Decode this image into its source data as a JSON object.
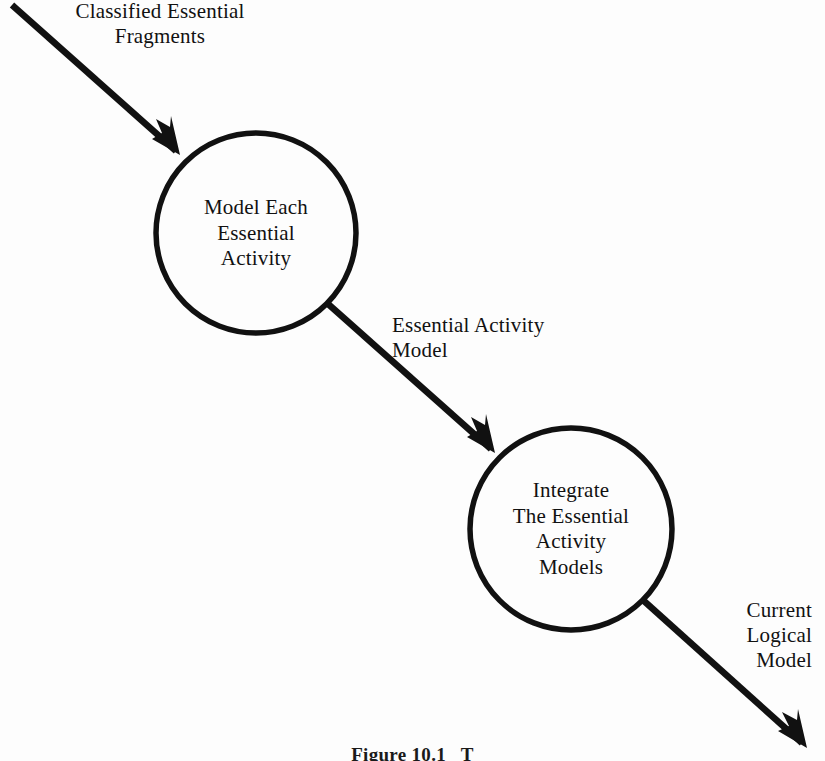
{
  "figure": {
    "caption": "Figure 10.1   T",
    "background_color": "#fdfdfd",
    "ink_color": "#111111"
  },
  "diagram": {
    "type": "process-flow",
    "nodes": [
      {
        "id": "model-each-essential-activity",
        "shape": "circle",
        "label": "Model Each\nEssential\nActivity",
        "cx": 256,
        "cy": 233,
        "r": 100
      },
      {
        "id": "integrate-the-essential-activity-models",
        "shape": "circle",
        "label": "Integrate\nThe Essential\nActivity\nModels",
        "cx": 571,
        "cy": 529,
        "r": 101
      }
    ],
    "flows": [
      {
        "id": "classified-essential-fragments",
        "label": "Classified Essential\nFragments",
        "from": "external",
        "to": "model-each-essential-activity",
        "x1": 12,
        "y1": 5,
        "x2": 178,
        "y2": 153
      },
      {
        "id": "essential-activity-model",
        "label": "Essential Activity\nModel",
        "from": "model-each-essential-activity",
        "to": "integrate-the-essential-activity-models",
        "x1": 327,
        "y1": 303,
        "x2": 494,
        "y2": 452
      },
      {
        "id": "current-logical-model",
        "label": "Current\nLogical\nModel",
        "from": "integrate-the-essential-activity-models",
        "to": "external",
        "x1": 644,
        "y1": 601,
        "x2": 806,
        "y2": 747
      }
    ]
  }
}
